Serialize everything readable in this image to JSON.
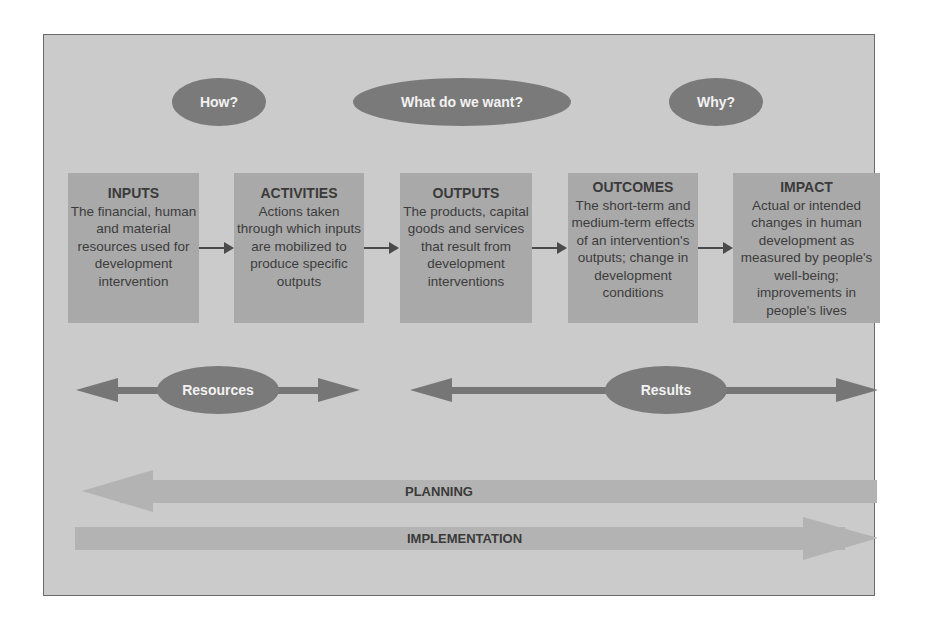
{
  "diagram": {
    "questions": [
      {
        "label": "How?"
      },
      {
        "label": "What do we want?"
      },
      {
        "label": "Why?"
      }
    ],
    "stages": [
      {
        "title": "INPUTS",
        "description": "The financial, human and material resources used for development intervention"
      },
      {
        "title": "ACTIVITIES",
        "description": "Actions taken through which inputs are mobilized to produce specific outputs"
      },
      {
        "title": "OUTPUTS",
        "description": "The products, capital goods and services that result from development interventions"
      },
      {
        "title": "OUTCOMES",
        "description": "The short-term and medium-term effects of an intervention's outputs; change in development conditions"
      },
      {
        "title": "IMPACT",
        "description": "Actual or intended changes in human development as measured by people's well-being; improvements in people's lives"
      }
    ],
    "groupings": [
      {
        "label": "Resources"
      },
      {
        "label": "Results"
      }
    ],
    "phases": [
      {
        "label": "PLANNING",
        "direction": "left"
      },
      {
        "label": "IMPLEMENTATION",
        "direction": "right"
      }
    ],
    "colors": {
      "background": "#cbcbcb",
      "box": "#a9a9a9",
      "ellipse": "#7a7a7a",
      "arrow_dark": "#767676",
      "band": "#b4b4b4"
    }
  }
}
